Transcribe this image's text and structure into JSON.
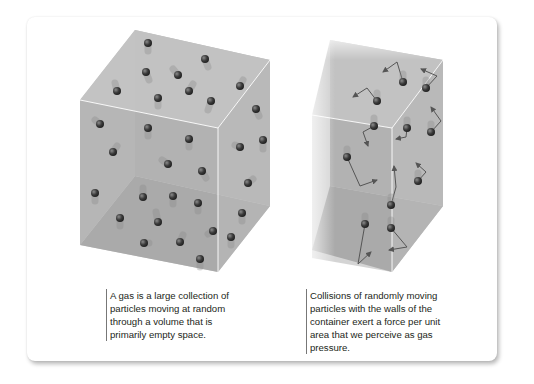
{
  "figure": {
    "panels": [
      {
        "id": "gas-volume",
        "caption_lines": [
          "A gas is a large collection of",
          "particles moving at random",
          "through a volume that is",
          "primarily empty space."
        ]
      },
      {
        "id": "gas-pressure",
        "caption_lines": [
          "Collisions of randomly moving",
          "particles with the walls of the",
          "container exert a force per unit",
          "area that we perceive as gas",
          "pressure."
        ]
      }
    ],
    "colors": {
      "box_face": "#a9a9a9",
      "box_edge": "#ffffff",
      "particle": "#3a3a3a",
      "arrow": "#555555"
    }
  }
}
